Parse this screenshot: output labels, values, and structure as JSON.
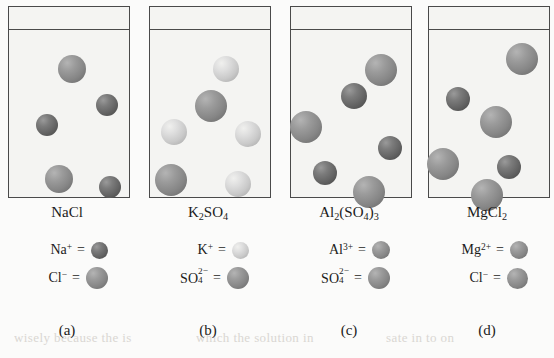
{
  "figure": {
    "type": "diagram",
    "background_text": [
      {
        "text": "wisely because the is",
        "x": 14,
        "y": 330
      },
      {
        "text": "which the solution in",
        "x": 196,
        "y": 330
      },
      {
        "text": "sate in to on",
        "x": 386,
        "y": 330
      },
      {
        "text": "the solution",
        "x": 40,
        "y": 152
      }
    ]
  },
  "panels": [
    {
      "id": "a",
      "label": "(a)",
      "formula": "NaCl",
      "formula_parts": [
        {
          "t": "NaCl"
        }
      ],
      "cation": {
        "name": "Na",
        "charge": "+",
        "color": "dark",
        "size": 16
      },
      "anion": {
        "name": "Cl",
        "charge": "−",
        "color": "mid",
        "size": 22
      },
      "legend": [
        {
          "ion": "Na",
          "charge": "+",
          "sub": "",
          "equals": "=",
          "color": "dark",
          "size": 17
        },
        {
          "ion": "Cl",
          "charge": "−",
          "sub": "",
          "equals": "=",
          "color": "mid",
          "size": 22
        }
      ],
      "spheres": [
        {
          "cx": 63,
          "cy": 62,
          "r": 14,
          "color": "mid"
        },
        {
          "cx": 98,
          "cy": 98,
          "r": 11,
          "color": "dark"
        },
        {
          "cx": 38,
          "cy": 118,
          "r": 11,
          "color": "dark"
        },
        {
          "cx": 50,
          "cy": 172,
          "r": 14,
          "color": "mid"
        },
        {
          "cx": 101,
          "cy": 180,
          "r": 11,
          "color": "dark"
        }
      ]
    },
    {
      "id": "b",
      "label": "(b)",
      "formula": "K2SO4",
      "formula_parts": [
        {
          "t": "K"
        },
        {
          "t": "2",
          "sub": true
        },
        {
          "t": "SO"
        },
        {
          "t": "4",
          "sub": true
        }
      ],
      "cation": {
        "name": "K",
        "charge": "+",
        "color": "light",
        "size": 16
      },
      "anion": {
        "name": "SO4",
        "charge": "2−",
        "color": "mid",
        "size": 22
      },
      "legend": [
        {
          "ion": "K",
          "charge": "+",
          "sub": "",
          "equals": "=",
          "color": "light",
          "size": 17
        },
        {
          "ion": "SO",
          "charge": "2−",
          "sub": "4",
          "equals": "=",
          "color": "mid",
          "size": 22
        }
      ],
      "spheres": [
        {
          "cx": 76,
          "cy": 62,
          "r": 13,
          "color": "light"
        },
        {
          "cx": 61,
          "cy": 99,
          "r": 16,
          "color": "mid"
        },
        {
          "cx": 24,
          "cy": 125,
          "r": 13,
          "color": "light"
        },
        {
          "cx": 98,
          "cy": 127,
          "r": 13,
          "color": "light"
        },
        {
          "cx": 21,
          "cy": 173,
          "r": 16,
          "color": "mid"
        },
        {
          "cx": 88,
          "cy": 177,
          "r": 13,
          "color": "light"
        }
      ]
    },
    {
      "id": "c",
      "label": "(c)",
      "formula": "Al2(SO4)3",
      "formula_parts": [
        {
          "t": "Al"
        },
        {
          "t": "2",
          "sub": true
        },
        {
          "t": "(SO"
        },
        {
          "t": "4",
          "sub": true
        },
        {
          "t": ")"
        },
        {
          "t": "3",
          "sub": true
        }
      ],
      "cation": {
        "name": "Al",
        "charge": "3+",
        "color": "dark",
        "size": 16
      },
      "anion": {
        "name": "SO4",
        "charge": "2−",
        "color": "mid",
        "size": 22
      },
      "legend": [
        {
          "ion": "Al",
          "charge": "3+",
          "sub": "",
          "equals": "=",
          "color": "mid",
          "size": 18
        },
        {
          "ion": "SO",
          "charge": "2−",
          "sub": "4",
          "equals": "=",
          "color": "mid",
          "size": 22
        }
      ],
      "spheres": [
        {
          "cx": 90,
          "cy": 63,
          "r": 16,
          "color": "mid"
        },
        {
          "cx": 63,
          "cy": 89,
          "r": 13,
          "color": "dark"
        },
        {
          "cx": 15,
          "cy": 120,
          "r": 16,
          "color": "mid"
        },
        {
          "cx": 99,
          "cy": 141,
          "r": 12,
          "color": "dark"
        },
        {
          "cx": 34,
          "cy": 166,
          "r": 12,
          "color": "dark"
        },
        {
          "cx": 78,
          "cy": 185,
          "r": 16,
          "color": "mid"
        }
      ]
    },
    {
      "id": "d",
      "label": "(d)",
      "formula": "MgCl2",
      "formula_parts": [
        {
          "t": "MgCl"
        },
        {
          "t": "2",
          "sub": true
        }
      ],
      "cation": {
        "name": "Mg",
        "charge": "2+",
        "color": "dark",
        "size": 16
      },
      "anion": {
        "name": "Cl",
        "charge": "−",
        "color": "mid",
        "size": 22
      },
      "legend": [
        {
          "ion": "Mg",
          "charge": "2+",
          "sub": "",
          "equals": "=",
          "color": "mid",
          "size": 18
        },
        {
          "ion": "Cl",
          "charge": "−",
          "sub": "",
          "equals": "=",
          "color": "mid",
          "size": 21
        }
      ],
      "spheres": [
        {
          "cx": 93,
          "cy": 52,
          "r": 16,
          "color": "mid"
        },
        {
          "cx": 29,
          "cy": 92,
          "r": 12,
          "color": "dark"
        },
        {
          "cx": 67,
          "cy": 115,
          "r": 16,
          "color": "mid"
        },
        {
          "cx": 14,
          "cy": 157,
          "r": 16,
          "color": "mid"
        },
        {
          "cx": 80,
          "cy": 160,
          "r": 12,
          "color": "dark"
        },
        {
          "cx": 58,
          "cy": 188,
          "r": 16,
          "color": "mid"
        }
      ]
    }
  ],
  "colors": {
    "outline": "#4a4a4a",
    "beaker_fill": "#f4f4f2",
    "page_bg": "#fbfbfa",
    "text": "#1b1b1b",
    "sphere_dark": "#646464",
    "sphere_mid": "#868686",
    "sphere_light": "#c9c9c9",
    "bleed_text": "#cfcbc6"
  }
}
